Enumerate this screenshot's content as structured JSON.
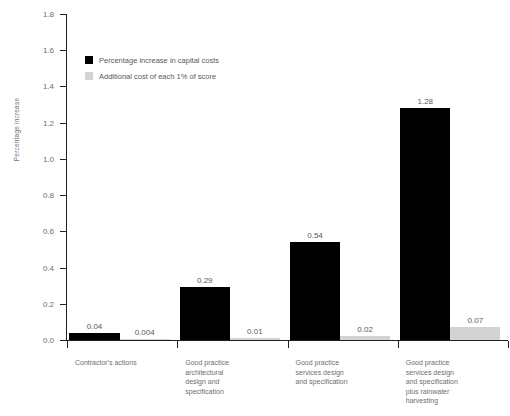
{
  "chart_data": {
    "type": "bar",
    "title": "",
    "xlabel": "",
    "ylabel": "Percentage increase",
    "ylim": [
      0.0,
      1.8
    ],
    "ytick_labels": [
      "0.0",
      "0.2",
      "0.4",
      "0.6",
      "0.8",
      "1.0",
      "1.2",
      "1.4",
      "1.6",
      "1.8"
    ],
    "ytick_values": [
      0.0,
      0.2,
      0.4,
      0.6,
      0.8,
      1.0,
      1.2,
      1.4,
      1.6,
      1.8
    ],
    "grid": false,
    "legend_position": "upper-left-inside",
    "categories": [
      "Contractor's actions",
      "Good practice architectural design and specification",
      "Good practice services design and specification",
      "Good practice services design and specification plus rainwater harvesting"
    ],
    "category_lines": [
      [
        "Contractor's actions"
      ],
      [
        "Good practice",
        "architectural",
        "design and",
        "specification"
      ],
      [
        "Good practice",
        "services design",
        "and specification"
      ],
      [
        "Good practice",
        "services design",
        "and specification",
        "plus rainwater",
        "harvesting"
      ]
    ],
    "series": [
      {
        "name": "Percentage increase in capital costs",
        "color": "#000000",
        "values": [
          0.04,
          0.29,
          0.54,
          1.28
        ],
        "labels": [
          "0.04",
          "0.29",
          "0.54",
          "1.28"
        ]
      },
      {
        "name": "Additional cost of each 1% of score",
        "color": "#d1d3d4",
        "values": [
          0.004,
          0.01,
          0.02,
          0.07
        ],
        "labels": [
          "0.004",
          "0.01",
          "0.02",
          "0.07"
        ]
      }
    ]
  },
  "legend": {
    "items": [
      {
        "label": "Percentage increase in capital costs",
        "color": "#000000"
      },
      {
        "label": "Additional cost of each 1% of score",
        "color": "#d1d3d4"
      }
    ]
  },
  "axis": {
    "y_title": "Percentage increase"
  },
  "colors": {
    "series_primary": "#000000",
    "series_secondary": "#d1d3d4",
    "axis": "#231f20",
    "text": "#58595b",
    "tick_text": "#6d6e71",
    "background": "#ffffff"
  }
}
